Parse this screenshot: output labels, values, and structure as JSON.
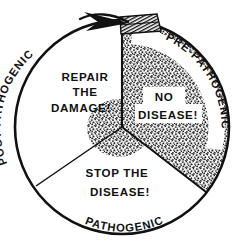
{
  "diagram": {
    "type": "cycle-wheel",
    "geometry": {
      "center_x": 122,
      "center_y": 127,
      "radius": 109,
      "canvas_width": 247,
      "canvas_height": 251
    },
    "colors": {
      "outline": "#111111",
      "background": "#ffffff",
      "stipple_fill": "#9a9a9a",
      "text": "#111111"
    },
    "arc_labels": {
      "post_pathogenic": "POST-PATHOGENIC",
      "pre_pathogenic": "PRE-PATHOGENIC",
      "pathogenic": "PATHOGENIC"
    },
    "sectors": [
      {
        "id": "post-pathogenic",
        "arc_label": "POST-PATHOGENIC",
        "shaded": false,
        "lines": [
          "REPAIR",
          "THE",
          "DAMAGE!"
        ]
      },
      {
        "id": "pre-pathogenic",
        "arc_label": "PRE-PATHOGENIC",
        "shaded": true,
        "boxed_lines": [
          "NO",
          "DISEASE!"
        ]
      },
      {
        "id": "pathogenic",
        "arc_label": "PATHOGENIC",
        "shaded": false,
        "lines": [
          "STOP  THE",
          "DISEASE!"
        ]
      }
    ],
    "arrow": {
      "name": "counter-clockwise-arrow",
      "direction": "counter-clockwise"
    }
  }
}
